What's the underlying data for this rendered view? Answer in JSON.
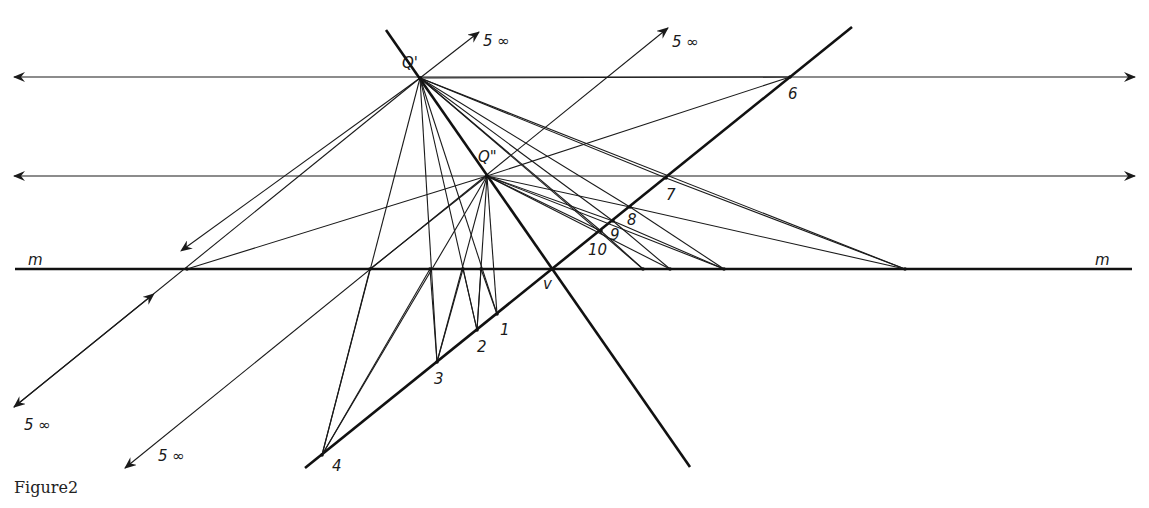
{
  "figure": {
    "caption": "Figure2",
    "labels": {
      "q_prime": "Q'",
      "q_double_prime": "Q\"",
      "line_m_left": "m",
      "line_m_right": "m",
      "v": "v",
      "p1": "1",
      "p2": "2",
      "p3": "3",
      "p4": "4",
      "p6": "6",
      "p7": "7",
      "p8": "8",
      "p9": "9",
      "p10": "10",
      "inf_top_left": "5 ∞",
      "inf_top_right": "5 ∞",
      "inf_bottom_left": "5 ∞",
      "inf_bottom_mid": "5 ∞"
    },
    "points": {
      "Q_prime": [
        420,
        78
      ],
      "Q_double_prime": [
        487,
        176
      ],
      "v": [
        552,
        269
      ],
      "1": [
        497,
        314
      ],
      "2": [
        477,
        330
      ],
      "3": [
        437,
        362
      ],
      "4": [
        322,
        455
      ],
      "6": [
        790,
        77
      ],
      "7": [
        666,
        178
      ],
      "8": [
        630,
        207
      ],
      "9": [
        613,
        221
      ],
      "10": [
        601,
        231
      ]
    },
    "m_intersections_x": [
      187,
      370,
      430,
      463,
      481,
      552,
      643,
      670,
      724,
      905
    ],
    "colors": {
      "ink": "#1a1a1a",
      "paper": "#ffffff"
    }
  }
}
